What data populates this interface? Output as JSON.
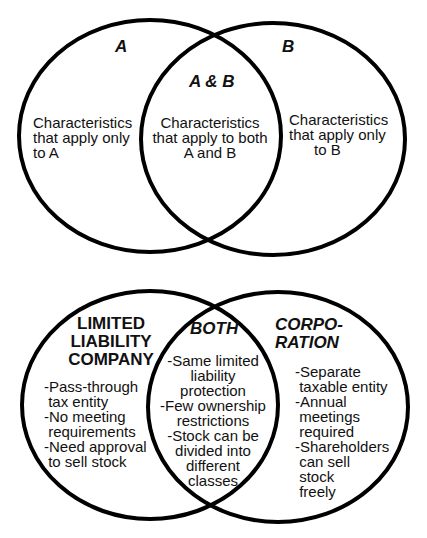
{
  "top_diagram": {
    "left_title": "A",
    "right_title": "B",
    "center_title": "A & B",
    "left_text": "Characteristics\nthat apply only\nto A",
    "center_text": "Characteristics\nthat apply to both\nA and B",
    "right_text": "Characteristics\nthat apply only\n      to B"
  },
  "bottom_diagram": {
    "left_title": "LIMITED\nLIABILITY\nCOMPANY",
    "center_title": "BOTH",
    "right_title": "CORPO-\nRATION",
    "left_items": "-Pass-through\n tax entity\n-No meeting\n requirements\n-Need approval\n to sell stock",
    "center_items": "-Same limited\nliability\nprotection\n-Few ownership\nrestrictions\n-Stock can be\ndivided into\ndifferent\nclasses",
    "right_items": "-Separate\n taxable entity\n-Annual\n meetings\n required\n-Shareholders\n can sell\n stock\n freely"
  },
  "colors": {
    "stroke": "#000000",
    "background": "#ffffff",
    "text": "#111111"
  }
}
